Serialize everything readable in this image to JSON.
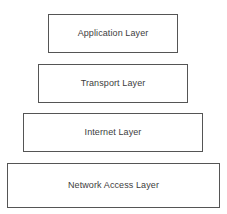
{
  "diagram": {
    "type": "layered-stack",
    "background_color": "#ffffff",
    "border_color": "#555555",
    "text_color": "#3d3d3d",
    "layers": [
      {
        "label": "Application Layer",
        "order": 1,
        "x": 48,
        "y": 14,
        "width": 130,
        "height": 39
      },
      {
        "label": "Transport Layer",
        "order": 2,
        "x": 38,
        "y": 64,
        "width": 150,
        "height": 39
      },
      {
        "label": "Internet Layer",
        "order": 3,
        "x": 23,
        "y": 113,
        "width": 180,
        "height": 39
      },
      {
        "label": "Network Access Layer",
        "order": 4,
        "x": 7,
        "y": 163,
        "width": 213,
        "height": 45
      }
    ]
  }
}
